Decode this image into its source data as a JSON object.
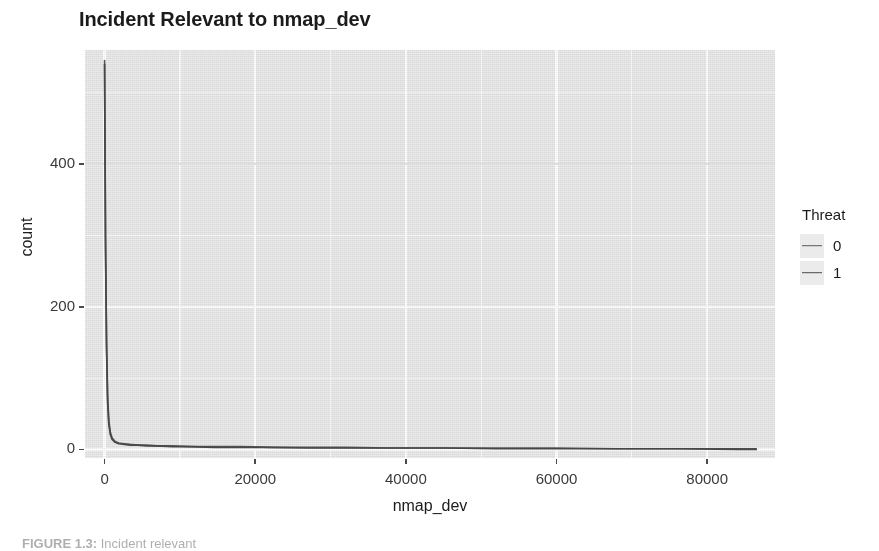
{
  "figure": {
    "title": "Incident Relevant to nmap_dev",
    "caption_prefix": "FIGURE 1.3:",
    "caption_body": " Incident relevant"
  },
  "axes": {
    "x": {
      "title": "nmap_dev",
      "ticks": [
        "0",
        "20000",
        "40000",
        "60000",
        "80000"
      ]
    },
    "y": {
      "title": "count",
      "ticks": [
        "0",
        "200",
        "400"
      ]
    }
  },
  "legend": {
    "title": "Threat",
    "items": [
      {
        "label": "0",
        "color": "#5a5a5a"
      },
      {
        "label": "1",
        "color": "#4a4a4a"
      }
    ]
  },
  "style": {
    "panel_background": "#ebebeb",
    "grid_color": "#ffffff",
    "line_color": "#4a4a4a",
    "text_color": "#1b1b1b"
  },
  "chart_data": {
    "type": "line",
    "title": "Incident Relevant to nmap_dev",
    "xlabel": "nmap_dev",
    "ylabel": "count",
    "xlim": [
      -2600,
      89000
    ],
    "ylim": [
      -12,
      560
    ],
    "xticks": [
      0,
      20000,
      40000,
      60000,
      80000
    ],
    "yticks": [
      0,
      200,
      400
    ],
    "grid": true,
    "legend_title": "Threat",
    "legend_position": "right",
    "series": [
      {
        "name": "0",
        "color": "#5a5a5a",
        "x": [
          0,
          120,
          260,
          400,
          560,
          760,
          1000,
          1400,
          1900,
          2600,
          3400,
          4400,
          5600,
          7000,
          9000,
          11500,
          14500,
          18000,
          22000,
          27000,
          32000,
          38000,
          45000,
          52000,
          60000,
          68000,
          76000,
          84000,
          86500
        ],
        "y": [
          545,
          300,
          150,
          74,
          40,
          24,
          16,
          11,
          9,
          8,
          7,
          6,
          6,
          5,
          5,
          4,
          4,
          4,
          3,
          3,
          3,
          2,
          2,
          2,
          2,
          1,
          1,
          1,
          1
        ]
      },
      {
        "name": "1",
        "color": "#4a4a4a",
        "x": [
          0,
          120,
          260,
          400,
          560,
          760,
          1000,
          1400,
          1900,
          2600,
          3400,
          4400,
          5600,
          7000,
          9000,
          11500,
          14500,
          18000,
          22000,
          27000,
          32000,
          38000,
          45000,
          52000,
          60000,
          68000,
          76000,
          84000,
          86500
        ],
        "y": [
          540,
          290,
          142,
          68,
          36,
          21,
          14,
          10,
          8,
          7,
          6,
          6,
          5,
          5,
          4,
          4,
          3,
          3,
          3,
          2,
          2,
          2,
          2,
          1,
          1,
          1,
          1,
          0,
          0
        ]
      }
    ],
    "annotations": [
      "Sharp spike at nmap_dev near 0 reaching count of roughly 545, then long flat tail near zero across the full x-range."
    ]
  }
}
